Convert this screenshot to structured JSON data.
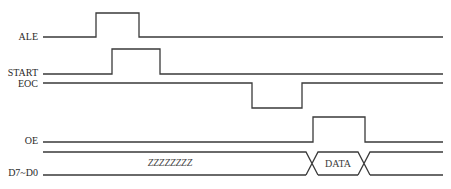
{
  "diagram": {
    "type": "timing-diagram",
    "signals": [
      {
        "name": "ALE",
        "label": "ALE",
        "label_y": 40,
        "high_y": 13,
        "low_y": 37,
        "initial": "low",
        "edges": [
          96,
          139
        ]
      },
      {
        "name": "START",
        "label": "START",
        "label_y": 76,
        "high_y": 49,
        "low_y": 74,
        "initial": "low",
        "edges": [
          112,
          160
        ]
      },
      {
        "name": "EOC",
        "label": "EOC",
        "label_y": 87,
        "high_y": 83,
        "low_y": 108,
        "initial": "high",
        "edges": [
          252,
          302
        ]
      },
      {
        "name": "OE",
        "label": "OE",
        "label_y": 144,
        "high_y": 117,
        "low_y": 142,
        "initial": "low",
        "edges": [
          313,
          365
        ]
      }
    ],
    "bus": {
      "name": "D7~D0",
      "label": "D7~D0",
      "label_y": 176,
      "top_y": 152,
      "bottom_y": 175,
      "crossings": [
        312,
        364
      ],
      "crossing_half_width": 6,
      "segments": [
        {
          "text": "ZZZZZZZZ",
          "x": 170,
          "style": "high-impedance"
        },
        {
          "text": "DATA",
          "x": 338,
          "style": "valid"
        },
        {
          "text": "",
          "x": 405,
          "style": "invalid"
        }
      ]
    },
    "x_start": 43,
    "x_end": 443,
    "label_right_x": 38
  }
}
